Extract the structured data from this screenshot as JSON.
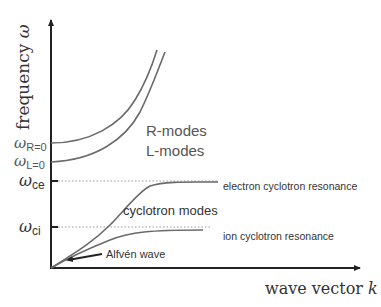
{
  "diagram": {
    "y_axis_label": "frequency ",
    "y_axis_symbol": "ω",
    "x_axis_label": "wave vector ",
    "x_axis_symbol": "k",
    "y_ticks": [
      {
        "id": "omega-R0",
        "base": "ω",
        "sub": "R=0"
      },
      {
        "id": "omega-L0",
        "base": "ω",
        "sub": "L=0"
      },
      {
        "id": "omega-ce",
        "base": "ω",
        "sub": "ce"
      },
      {
        "id": "omega-ci",
        "base": "ω",
        "sub": "ci"
      }
    ],
    "labels": {
      "r_modes": "R-modes",
      "l_modes": "L-modes",
      "cyclotron_modes": "cyclotron modes",
      "electron_resonance": "electron cyclotron resonance",
      "ion_resonance": "ion cyclotron resonance",
      "alfven_wave": "Alfvén wave"
    },
    "colors": {
      "axis": "#222222",
      "curves": "#6a6a6a",
      "text": "#555555"
    }
  }
}
